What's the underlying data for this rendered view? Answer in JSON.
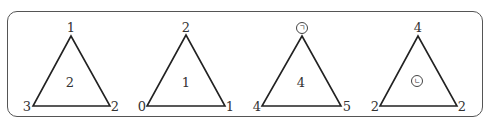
{
  "diagram": {
    "triangles": [
      {
        "id": "triangle-1",
        "top": "1",
        "bottom_left": "3",
        "bottom_right": "2",
        "center": "2"
      },
      {
        "id": "triangle-2",
        "top": "2",
        "bottom_left": "0",
        "bottom_right": "1",
        "center": "1"
      },
      {
        "id": "triangle-3",
        "top": "㉠",
        "bottom_left": "4",
        "bottom_right": "5",
        "center": "4"
      },
      {
        "id": "triangle-4",
        "top": "4",
        "bottom_left": "2",
        "bottom_right": "2",
        "center": "㉡"
      }
    ]
  }
}
